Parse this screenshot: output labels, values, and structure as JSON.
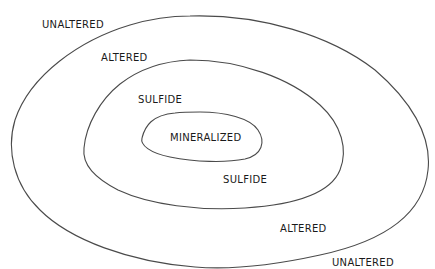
{
  "diagram": {
    "type": "concentric-zonation",
    "zones": [
      {
        "id": "outer",
        "boundary": "unaltered/altered"
      },
      {
        "id": "middle",
        "boundary": "altered/sulfide"
      },
      {
        "id": "inner",
        "boundary": "sulfide/mineralized"
      }
    ],
    "labels": {
      "unaltered_top": "UNALTERED",
      "altered_top": "ALTERED",
      "sulfide_top": "SULFIDE",
      "mineralized": "MINERALIZED",
      "sulfide_bottom": "SULFIDE",
      "altered_bottom": "ALTERED",
      "unaltered_bottom": "UNALTERED"
    },
    "colors": {
      "line": "#4a4a4a",
      "text": "#1a1a1a",
      "background": "#ffffff"
    }
  }
}
